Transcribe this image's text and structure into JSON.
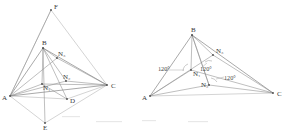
{
  "page": {
    "background_color": "#ffffff",
    "width": 285,
    "height": 132,
    "ink_color": "#8a8a8a",
    "label_color": "#3a3a3a"
  },
  "figures": [
    {
      "id": "left-figure",
      "name": "fermat-point-construction-with-equilateral-triangles",
      "vertex_labels": [
        "A",
        "B",
        "C",
        "D",
        "E",
        "F"
      ],
      "interior_point_labels": [
        "N₁",
        "N₂",
        "N₃"
      ],
      "points": {
        "A": {
          "label": "A",
          "x": 10,
          "y": 96
        },
        "B": {
          "label": "B",
          "x": 43,
          "y": 48
        },
        "C": {
          "label": "C",
          "x": 107,
          "y": 85
        },
        "D": {
          "label": "D",
          "x": 67,
          "y": 99
        },
        "E": {
          "label": "E",
          "x": 45,
          "y": 123
        },
        "F": {
          "label": "F",
          "x": 51,
          "y": 10
        },
        "N1": {
          "label": "N₁",
          "x": 42,
          "y": 84
        },
        "N2": {
          "label": "N₂",
          "x": 66,
          "y": 81
        },
        "N3": {
          "label": "N₃",
          "x": 57,
          "y": 58
        }
      },
      "label_offsets": {
        "A": {
          "dx": -8,
          "dy": 4
        },
        "B": {
          "dx": -1,
          "dy": -3
        },
        "C": {
          "dx": 4,
          "dy": 3
        },
        "D": {
          "dx": 3,
          "dy": 4
        },
        "E": {
          "dx": 0,
          "dy": 7
        },
        "F": {
          "dx": 3,
          "dy": -2
        },
        "N1": {
          "dx": 1,
          "dy": 5
        },
        "N2": {
          "dx": 1,
          "dy": -2
        },
        "N3": {
          "dx": 2,
          "dy": -2
        }
      }
    },
    {
      "id": "right-figure",
      "name": "fermat-point-construction-with-120-degree-angles",
      "vertex_labels": [
        "A",
        "B",
        "C"
      ],
      "interior_point_labels": [
        "N₁",
        "N₂",
        "N₃"
      ],
      "angle_labels": [
        "120°",
        "120°",
        "120°"
      ],
      "points": {
        "A": {
          "label": "A",
          "x": 150,
          "y": 96
        },
        "B": {
          "label": "B",
          "x": 192,
          "y": 35
        },
        "C": {
          "label": "C",
          "x": 273,
          "y": 93
        },
        "N1": {
          "label": "N₁",
          "x": 191,
          "y": 70
        },
        "N2": {
          "label": "N₂",
          "x": 209,
          "y": 85
        },
        "N3": {
          "label": "N₃",
          "x": 213,
          "y": 55
        }
      },
      "label_offsets": {
        "A": {
          "dx": -8,
          "dy": 3
        },
        "B": {
          "dx": -1,
          "dy": -3
        },
        "C": {
          "dx": 4,
          "dy": 3
        },
        "N1": {
          "dx": 2,
          "dy": 6
        },
        "N2": {
          "dx": -7,
          "dy": 2
        },
        "N3": {
          "dx": 3,
          "dy": -2
        }
      },
      "angles": [
        {
          "text": "120°",
          "x": 163,
          "y": 69,
          "name": "angle-120-left"
        },
        {
          "text": "120°",
          "x": 204,
          "y": 70,
          "name": "angle-120-middle"
        },
        {
          "text": "120°",
          "x": 228,
          "y": 79,
          "name": "angle-120-right"
        }
      ]
    }
  ]
}
